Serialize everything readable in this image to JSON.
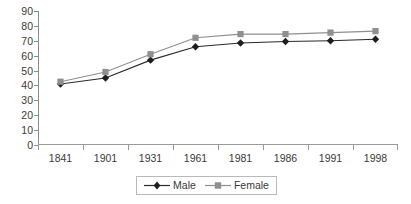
{
  "chart_data": {
    "type": "line",
    "title": "",
    "subtitle": "",
    "xlabel": "",
    "ylabel": "",
    "categories": [
      "1841",
      "1901",
      "1931",
      "1961",
      "1981",
      "1986",
      "1991",
      "1998"
    ],
    "series": [
      {
        "name": "Male",
        "color": "#2b2b2b",
        "marker": "diamond",
        "values": [
          41,
          45,
          57,
          66,
          68.5,
          69.5,
          70,
          71
        ]
      },
      {
        "name": "Female",
        "color": "#8f8f8f",
        "marker": "square",
        "values": [
          42.5,
          49,
          61,
          72,
          74.5,
          74.5,
          75.5,
          76.5
        ]
      }
    ],
    "ylim": [
      0,
      90
    ],
    "ytick_step": 10,
    "yticks": [
      "0",
      "10",
      "20",
      "30",
      "40",
      "50",
      "60",
      "70",
      "80",
      "90"
    ],
    "grid": false,
    "legend_position": "bottom-center"
  },
  "legend": {
    "entries": [
      {
        "label": "Male"
      },
      {
        "label": "Female"
      }
    ]
  },
  "colors": {
    "male_line": "#2b2b2b",
    "female_line": "#8f8f8f",
    "axis": "#8c8c8c",
    "text": "#3a3a3a",
    "background": "#ffffff",
    "legend_border": "#b9b9b9"
  }
}
